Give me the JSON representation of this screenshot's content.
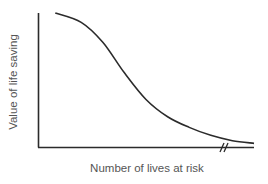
{
  "chart_data": {
    "type": "line",
    "title": "",
    "xlabel": "Number of lives at risk",
    "ylabel": "Value of life saving",
    "x_ticks": [],
    "y_ticks": [],
    "grid": false,
    "legend": null,
    "x_axis_break": true,
    "series": [
      {
        "name": "Value of life saving",
        "description": "Decreasing sigmoid curve: high and flat at few lives at risk, steep decline in the middle, flattening asymptotically toward zero at many lives at risk",
        "x": [
          0.08,
          0.2,
          0.3,
          0.4,
          0.5,
          0.6,
          0.7,
          0.8,
          0.9,
          1.0
        ],
        "values": [
          1.0,
          0.93,
          0.78,
          0.55,
          0.35,
          0.22,
          0.14,
          0.08,
          0.04,
          0.02
        ]
      }
    ],
    "xlim": [
      0,
      1
    ],
    "ylim": [
      0,
      1
    ]
  },
  "colors": {
    "axis": "#2b2b2b",
    "curve": "#2b2b2b",
    "label": "#555555"
  }
}
